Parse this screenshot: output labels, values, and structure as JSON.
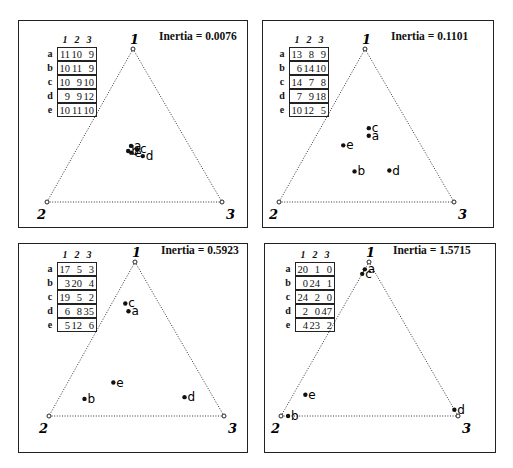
{
  "chart_data": [
    {
      "type": "scatter",
      "subtype": "ternary",
      "title": "Inertia = 0.0076",
      "inertia": 0.0076,
      "vertices": [
        "1",
        "2",
        "3"
      ],
      "columns": [
        "1",
        "2",
        "3"
      ],
      "rows": [
        "a",
        "b",
        "c",
        "d",
        "e"
      ],
      "table": [
        [
          11,
          10,
          9
        ],
        [
          10,
          11,
          9
        ],
        [
          10,
          9,
          10
        ],
        [
          9,
          9,
          12
        ],
        [
          10,
          11,
          10
        ]
      ],
      "points": [
        {
          "label": "a",
          "values": [
            11,
            10,
            9
          ]
        },
        {
          "label": "b",
          "values": [
            10,
            11,
            9
          ]
        },
        {
          "label": "c",
          "values": [
            10,
            9,
            10
          ]
        },
        {
          "label": "d",
          "values": [
            9,
            9,
            12
          ]
        },
        {
          "label": "e",
          "values": [
            10,
            11,
            10
          ]
        }
      ]
    },
    {
      "type": "scatter",
      "subtype": "ternary",
      "title": "Inertia = 0.1101",
      "inertia": 0.1101,
      "vertices": [
        "1",
        "2",
        "3"
      ],
      "columns": [
        "1",
        "2",
        "3"
      ],
      "rows": [
        "a",
        "b",
        "c",
        "d",
        "e"
      ],
      "table": [
        [
          13,
          8,
          9
        ],
        [
          6,
          14,
          10
        ],
        [
          14,
          7,
          8
        ],
        [
          7,
          9,
          18
        ],
        [
          10,
          12,
          5
        ]
      ],
      "points": [
        {
          "label": "a",
          "values": [
            13,
            8,
            9
          ]
        },
        {
          "label": "b",
          "values": [
            6,
            14,
            10
          ]
        },
        {
          "label": "c",
          "values": [
            14,
            7,
            8
          ]
        },
        {
          "label": "d",
          "values": [
            7,
            9,
            18
          ]
        },
        {
          "label": "e",
          "values": [
            10,
            12,
            5
          ]
        }
      ]
    },
    {
      "type": "scatter",
      "subtype": "ternary",
      "title": "Inertia = 0.5923",
      "inertia": 0.5923,
      "vertices": [
        "1",
        "2",
        "3"
      ],
      "columns": [
        "1",
        "2",
        "3"
      ],
      "rows": [
        "a",
        "b",
        "c",
        "d",
        "e"
      ],
      "table": [
        [
          17,
          5,
          3
        ],
        [
          3,
          20,
          4
        ],
        [
          19,
          5,
          2
        ],
        [
          6,
          8,
          35
        ],
        [
          5,
          12,
          6
        ]
      ],
      "points": [
        {
          "label": "a",
          "values": [
            17,
            5,
            3
          ]
        },
        {
          "label": "b",
          "values": [
            3,
            20,
            4
          ]
        },
        {
          "label": "c",
          "values": [
            19,
            5,
            2
          ]
        },
        {
          "label": "d",
          "values": [
            6,
            8,
            35
          ]
        },
        {
          "label": "e",
          "values": [
            5,
            12,
            6
          ]
        }
      ]
    },
    {
      "type": "scatter",
      "subtype": "ternary",
      "title": "Inertia = 1.5715",
      "inertia": 1.5715,
      "vertices": [
        "1",
        "2",
        "3"
      ],
      "columns": [
        "1",
        "2",
        "3"
      ],
      "rows": [
        "a",
        "b",
        "c",
        "d",
        "e"
      ],
      "table": [
        [
          20,
          1,
          0
        ],
        [
          0,
          24,
          1
        ],
        [
          24,
          2,
          0
        ],
        [
          2,
          0,
          47
        ],
        [
          4,
          23,
          2
        ]
      ],
      "points": [
        {
          "label": "a",
          "values": [
            20,
            1,
            0
          ]
        },
        {
          "label": "b",
          "values": [
            0,
            24,
            1
          ]
        },
        {
          "label": "c",
          "values": [
            24,
            2,
            0
          ]
        },
        {
          "label": "d",
          "values": [
            2,
            0,
            47
          ]
        },
        {
          "label": "e",
          "values": [
            4,
            23,
            2
          ]
        }
      ]
    }
  ],
  "panels": [
    {
      "inertia_label": "Inertia = 0.0076",
      "headers": [
        "1",
        "2",
        "3"
      ],
      "rows": [
        {
          "label": "a",
          "cells": [
            "11",
            "10",
            "9"
          ]
        },
        {
          "label": "b",
          "cells": [
            "10",
            "11",
            "9"
          ]
        },
        {
          "label": "c",
          "cells": [
            "10",
            "9",
            "10"
          ]
        },
        {
          "label": "d",
          "cells": [
            "9",
            "9",
            "12"
          ]
        },
        {
          "label": "e",
          "cells": [
            "10",
            "11",
            "10"
          ]
        }
      ],
      "vertex_labels": [
        "1",
        "2",
        "3"
      ]
    },
    {
      "inertia_label": "Inertia = 0.1101",
      "headers": [
        "1",
        "2",
        "3"
      ],
      "rows": [
        {
          "label": "a",
          "cells": [
            "13",
            "8",
            "9"
          ]
        },
        {
          "label": "b",
          "cells": [
            "6",
            "14",
            "10"
          ]
        },
        {
          "label": "c",
          "cells": [
            "14",
            "7",
            "8"
          ]
        },
        {
          "label": "d",
          "cells": [
            "7",
            "9",
            "18"
          ]
        },
        {
          "label": "e",
          "cells": [
            "10",
            "12",
            "5"
          ]
        }
      ],
      "vertex_labels": [
        "1",
        "2",
        "3"
      ]
    },
    {
      "inertia_label": "Inertia = 0.5923",
      "headers": [
        "1",
        "2",
        "3"
      ],
      "rows": [
        {
          "label": "a",
          "cells": [
            "17",
            "5",
            "3"
          ]
        },
        {
          "label": "b",
          "cells": [
            "3",
            "20",
            "4"
          ]
        },
        {
          "label": "c",
          "cells": [
            "19",
            "5",
            "2"
          ]
        },
        {
          "label": "d",
          "cells": [
            "6",
            "8",
            "35"
          ]
        },
        {
          "label": "e",
          "cells": [
            "5",
            "12",
            "6"
          ]
        }
      ],
      "vertex_labels": [
        "1",
        "2",
        "3"
      ]
    },
    {
      "inertia_label": "Inertia = 1.5715",
      "headers": [
        "1",
        "2",
        "3"
      ],
      "rows": [
        {
          "label": "a",
          "cells": [
            "20",
            "1",
            "0"
          ]
        },
        {
          "label": "b",
          "cells": [
            "0",
            "24",
            "1"
          ]
        },
        {
          "label": "c",
          "cells": [
            "24",
            "2",
            "0"
          ]
        },
        {
          "label": "d",
          "cells": [
            "2",
            "0",
            "47"
          ]
        },
        {
          "label": "e",
          "cells": [
            "4",
            "23",
            "2"
          ]
        }
      ],
      "vertex_labels": [
        "1",
        "2",
        "3"
      ]
    }
  ]
}
